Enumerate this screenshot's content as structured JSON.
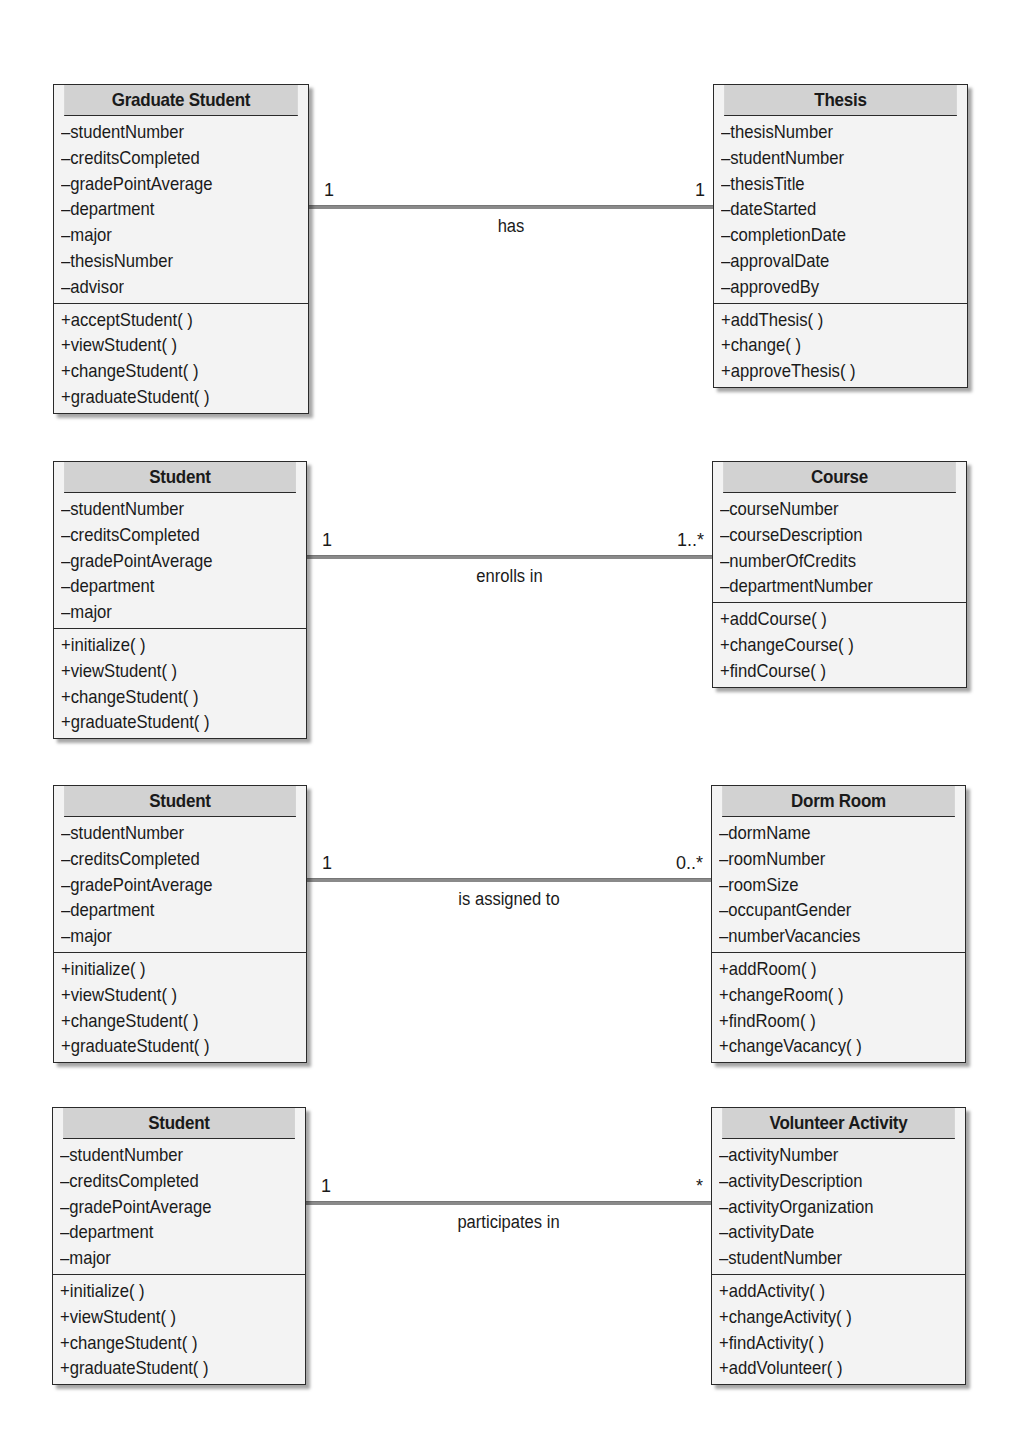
{
  "associations": [
    {
      "left": {
        "name": "Graduate Student",
        "attributes": [
          "–studentNumber",
          "–creditsCompleted",
          "–gradePointAverage",
          "–department",
          "–major",
          "–thesisNumber",
          "–advisor"
        ],
        "methods": [
          "+acceptStudent( )",
          "+viewStudent( )",
          "+changeStudent( )",
          "+graduateStudent( )"
        ]
      },
      "right": {
        "name": "Thesis",
        "attributes": [
          "–thesisNumber",
          "–studentNumber",
          "–thesisTitle",
          "–dateStarted",
          "–completionDate",
          "–approvalDate",
          "–approvedBy"
        ],
        "methods": [
          "+addThesis( )",
          "+change( )",
          "+approveThesis( )"
        ]
      },
      "left_multiplicity": "1",
      "right_multiplicity": "1",
      "label": "has"
    },
    {
      "left": {
        "name": "Student",
        "attributes": [
          "–studentNumber",
          "–creditsCompleted",
          "–gradePointAverage",
          "–department",
          "–major"
        ],
        "methods": [
          "+initialize( )",
          "+viewStudent( )",
          "+changeStudent( )",
          "+graduateStudent( )"
        ]
      },
      "right": {
        "name": "Course",
        "attributes": [
          "–courseNumber",
          "–courseDescription",
          "–numberOfCredits",
          "–departmentNumber"
        ],
        "methods": [
          "+addCourse( )",
          "+changeCourse( )",
          "+findCourse( )"
        ]
      },
      "left_multiplicity": "1",
      "right_multiplicity": "1..*",
      "label": "enrolls in"
    },
    {
      "left": {
        "name": "Student",
        "attributes": [
          "–studentNumber",
          "–creditsCompleted",
          "–gradePointAverage",
          "–department",
          "–major"
        ],
        "methods": [
          "+initialize( )",
          "+viewStudent( )",
          "+changeStudent( )",
          "+graduateStudent( )"
        ]
      },
      "right": {
        "name": "Dorm Room",
        "attributes": [
          "–dormName",
          "–roomNumber",
          "–roomSize",
          "–occupantGender",
          "–numberVacancies"
        ],
        "methods": [
          "+addRoom( )",
          "+changeRoom( )",
          "+findRoom( )",
          "+changeVacancy( )"
        ]
      },
      "left_multiplicity": "1",
      "right_multiplicity": "0..*",
      "label": "is assigned to"
    },
    {
      "left": {
        "name": "Student",
        "attributes": [
          "–studentNumber",
          "–creditsCompleted",
          "–gradePointAverage",
          "–department",
          "–major"
        ],
        "methods": [
          "+initialize( )",
          "+viewStudent( )",
          "+changeStudent( )",
          "+graduateStudent( )"
        ]
      },
      "right": {
        "name": "Volunteer Activity",
        "attributes": [
          "–activityNumber",
          "–activityDescription",
          "–activityOrganization",
          "–activityDate",
          "–studentNumber"
        ],
        "methods": [
          "+addActivity( )",
          "+changeActivity( )",
          "+findActivity( )",
          "+addVolunteer( )"
        ]
      },
      "left_multiplicity": "1",
      "right_multiplicity": "*",
      "label": "participates in"
    }
  ],
  "colors": {
    "header_fill": "#d2d2d2",
    "body_fill": "#f3f3f3",
    "border": "#2a2a2a",
    "association_line": "#8a8a8a"
  }
}
